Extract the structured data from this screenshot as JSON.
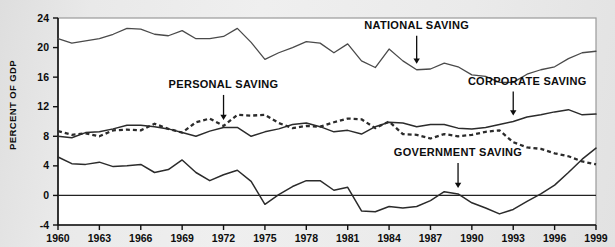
{
  "chart_data": {
    "type": "line",
    "title": "",
    "xlabel": "",
    "ylabel": "PERCENT OF GDP",
    "xlim": [
      1960,
      1999
    ],
    "ylim": [
      -4,
      24
    ],
    "yticks": [
      "24",
      "20",
      "16",
      "12",
      "8",
      "4",
      "0",
      "-4"
    ],
    "ytick_values": [
      24,
      20,
      16,
      12,
      8,
      4,
      0,
      -4
    ],
    "xticks": [
      "1960",
      "1963",
      "1966",
      "1969",
      "1972",
      "1975",
      "1978",
      "1981",
      "1984",
      "1987",
      "1990",
      "1993",
      "1996",
      "1999"
    ],
    "xtick_values": [
      1960,
      1963,
      1966,
      1969,
      1972,
      1975,
      1978,
      1981,
      1984,
      1987,
      1990,
      1993,
      1996,
      1999
    ],
    "grid": false,
    "legend_position": "inline-annotations",
    "zero_reference_line": 0,
    "x": [
      1960,
      1961,
      1962,
      1963,
      1964,
      1965,
      1966,
      1967,
      1968,
      1969,
      1970,
      1971,
      1972,
      1973,
      1974,
      1975,
      1976,
      1977,
      1978,
      1979,
      1980,
      1981,
      1982,
      1983,
      1984,
      1985,
      1986,
      1987,
      1988,
      1989,
      1990,
      1991,
      1992,
      1993,
      1994,
      1995,
      1996,
      1997,
      1998,
      1999
    ],
    "series": [
      {
        "name": "NATIONAL SAVING",
        "style": "solid",
        "color": "#4a4a4a",
        "values": [
          21.2,
          20.6,
          20.9,
          21.2,
          21.8,
          22.6,
          22.5,
          21.8,
          21.6,
          22.3,
          21.2,
          21.2,
          21.5,
          22.6,
          20.7,
          18.4,
          19.3,
          20.0,
          20.8,
          20.6,
          19.3,
          20.5,
          18.2,
          17.3,
          19.8,
          18.2,
          17.0,
          17.1,
          17.9,
          17.4,
          16.3,
          16.1,
          15.3,
          15.3,
          16.4,
          17.0,
          17.4,
          18.5,
          19.3,
          19.5
        ]
      },
      {
        "name": "PERSONAL SAVING",
        "style": "dashed",
        "color": "#2b2b2b",
        "values": [
          8.7,
          8.2,
          8.4,
          8.0,
          8.8,
          8.9,
          8.8,
          9.7,
          9.0,
          8.5,
          9.9,
          10.4,
          9.4,
          10.9,
          10.8,
          10.9,
          9.8,
          9.1,
          9.4,
          9.3,
          9.9,
          10.4,
          10.3,
          9.1,
          10.0,
          8.3,
          8.2,
          7.7,
          8.3,
          8.0,
          8.2,
          8.6,
          8.8,
          7.2,
          6.5,
          6.3,
          5.7,
          5.3,
          4.6,
          4.2
        ]
      },
      {
        "name": "CORPORATE SAVING",
        "style": "solid",
        "color": "#2b2b2b",
        "values": [
          8.0,
          7.8,
          8.5,
          8.6,
          9.0,
          9.5,
          9.5,
          9.3,
          9.0,
          8.5,
          8.0,
          8.7,
          9.2,
          9.2,
          8.0,
          8.6,
          9.0,
          9.6,
          9.8,
          9.3,
          8.6,
          8.8,
          8.3,
          9.3,
          9.9,
          9.8,
          9.3,
          9.6,
          9.6,
          9.1,
          9.0,
          9.2,
          9.6,
          10.0,
          10.6,
          10.9,
          11.3,
          11.6,
          10.9,
          11.0
        ]
      },
      {
        "name": "GOVERNMENT SAVING",
        "style": "solid",
        "color": "#2b2b2b",
        "values": [
          5.2,
          4.3,
          4.2,
          4.5,
          3.9,
          4.0,
          4.2,
          3.1,
          3.5,
          4.8,
          3.1,
          2.0,
          2.8,
          3.4,
          1.9,
          -1.2,
          0.1,
          1.2,
          2.0,
          2.0,
          0.7,
          1.1,
          -2.1,
          -2.2,
          -1.5,
          -1.7,
          -1.5,
          -0.7,
          0.5,
          0.2,
          -1.0,
          -1.7,
          -2.5,
          -1.9,
          -0.8,
          0.2,
          1.4,
          3.1,
          4.9,
          6.4
        ]
      }
    ],
    "annotations": [
      {
        "text": "NATIONAL SAVING",
        "target_year": 1986,
        "target_value": 17.0
      },
      {
        "text": "PERSONAL SAVING",
        "target_year": 1972,
        "target_value": 9.4
      },
      {
        "text": "CORPORATE SAVING",
        "target_year": 1993,
        "target_value": 10.0
      },
      {
        "text": "GOVERNMENT SAVING",
        "target_year": 1989,
        "target_value": 0.2
      }
    ]
  }
}
